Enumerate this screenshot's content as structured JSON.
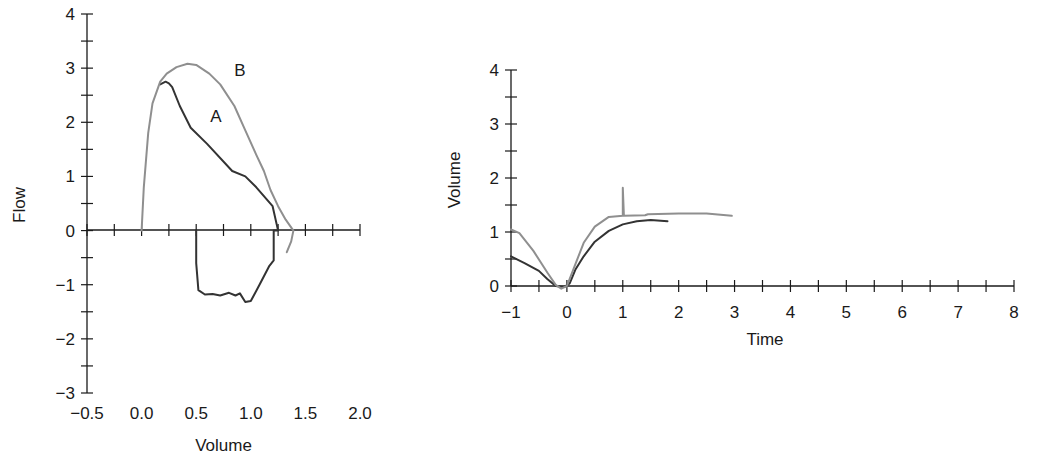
{
  "chart_data": [
    {
      "type": "line",
      "title": "",
      "xlabel": "Volume",
      "ylabel": "Flow",
      "xlim": [
        -0.5,
        2.0
      ],
      "ylim": [
        -3,
        4
      ],
      "xticks": [
        -0.5,
        0.0,
        0.5,
        1.0,
        1.5,
        2.0
      ],
      "xtick_labels": [
        "−0.5",
        "0.0",
        "0.5",
        "1.0",
        "1.5",
        "2.0"
      ],
      "yticks": [
        -3,
        -2,
        -1,
        0,
        1,
        2,
        3,
        4
      ],
      "ytick_labels": [
        "−3",
        "−2",
        "−1",
        "0",
        "1",
        "2",
        "3",
        "4"
      ],
      "grid": false,
      "legend": "none",
      "annotations": [
        {
          "text": "A",
          "x": 0.68,
          "y": 2.0
        },
        {
          "text": "B",
          "x": 0.9,
          "y": 2.85
        }
      ],
      "series": [
        {
          "name": "A",
          "color": "#333333",
          "points": [
            [
              0.5,
              0.0
            ],
            [
              0.5,
              -0.6
            ],
            [
              0.52,
              -1.1
            ],
            [
              0.58,
              -1.18
            ],
            [
              0.65,
              -1.17
            ],
            [
              0.72,
              -1.2
            ],
            [
              0.8,
              -1.15
            ],
            [
              0.86,
              -1.2
            ],
            [
              0.9,
              -1.16
            ],
            [
              0.95,
              -1.32
            ],
            [
              1.0,
              -1.3
            ],
            [
              1.08,
              -1.0
            ],
            [
              1.17,
              -0.65
            ],
            [
              1.21,
              -0.55
            ],
            [
              1.21,
              0.0
            ],
            [
              1.25,
              0.0
            ],
            [
              1.2,
              0.45
            ],
            [
              1.05,
              0.8
            ],
            [
              0.95,
              1.0
            ],
            [
              0.83,
              1.1
            ],
            [
              0.6,
              1.6
            ],
            [
              0.45,
              1.9
            ],
            [
              0.35,
              2.3
            ],
            [
              0.28,
              2.65
            ],
            [
              0.25,
              2.72
            ],
            [
              0.22,
              2.75
            ],
            [
              0.17,
              2.7
            ]
          ]
        },
        {
          "name": "B",
          "color": "#8f8f8f",
          "points": [
            [
              0.0,
              0.0
            ],
            [
              0.02,
              0.8
            ],
            [
              0.06,
              1.8
            ],
            [
              0.1,
              2.35
            ],
            [
              0.17,
              2.75
            ],
            [
              0.23,
              2.9
            ],
            [
              0.32,
              3.02
            ],
            [
              0.42,
              3.08
            ],
            [
              0.5,
              3.06
            ],
            [
              0.62,
              2.9
            ],
            [
              0.72,
              2.7
            ],
            [
              0.85,
              2.3
            ],
            [
              0.95,
              1.85
            ],
            [
              1.05,
              1.4
            ],
            [
              1.12,
              1.1
            ],
            [
              1.18,
              0.75
            ],
            [
              1.25,
              0.45
            ],
            [
              1.32,
              0.2
            ],
            [
              1.39,
              0.0
            ],
            [
              1.37,
              -0.2
            ],
            [
              1.33,
              -0.4
            ]
          ]
        }
      ]
    },
    {
      "type": "line",
      "title": "",
      "xlabel": "Time",
      "ylabel": "Volume",
      "xlim": [
        -1,
        8
      ],
      "ylim": [
        0,
        4
      ],
      "xticks": [
        -1,
        0,
        1,
        2,
        3,
        4,
        5,
        6,
        7,
        8
      ],
      "xtick_labels": [
        "−1",
        "0",
        "1",
        "2",
        "3",
        "4",
        "5",
        "6",
        "7",
        "8"
      ],
      "yticks": [
        0,
        1,
        2,
        3,
        4
      ],
      "ytick_labels": [
        "0",
        "1",
        "2",
        "3",
        "4"
      ],
      "grid": false,
      "legend": "none",
      "series": [
        {
          "name": "A",
          "color": "#333333",
          "points": [
            [
              -1.0,
              0.55
            ],
            [
              -0.75,
              0.42
            ],
            [
              -0.5,
              0.28
            ],
            [
              -0.35,
              0.13
            ],
            [
              -0.2,
              0.0
            ],
            [
              -0.05,
              -0.02
            ],
            [
              0.05,
              0.05
            ],
            [
              0.15,
              0.3
            ],
            [
              0.3,
              0.55
            ],
            [
              0.5,
              0.82
            ],
            [
              0.75,
              1.02
            ],
            [
              1.0,
              1.14
            ],
            [
              1.25,
              1.2
            ],
            [
              1.5,
              1.22
            ],
            [
              1.8,
              1.2
            ]
          ]
        },
        {
          "name": "B",
          "color": "#8f8f8f",
          "points": [
            [
              -1.0,
              1.05
            ],
            [
              -0.85,
              0.98
            ],
            [
              -0.6,
              0.65
            ],
            [
              -0.35,
              0.25
            ],
            [
              -0.2,
              0.02
            ],
            [
              -0.1,
              -0.05
            ],
            [
              0.0,
              0.0
            ],
            [
              0.15,
              0.4
            ],
            [
              0.3,
              0.8
            ],
            [
              0.5,
              1.1
            ],
            [
              0.75,
              1.28
            ],
            [
              1.0,
              1.3
            ],
            [
              1.0,
              1.82
            ],
            [
              1.02,
              1.3
            ],
            [
              1.4,
              1.31
            ],
            [
              1.45,
              1.33
            ],
            [
              2.0,
              1.34
            ],
            [
              2.5,
              1.34
            ],
            [
              2.95,
              1.3
            ]
          ]
        }
      ]
    }
  ]
}
